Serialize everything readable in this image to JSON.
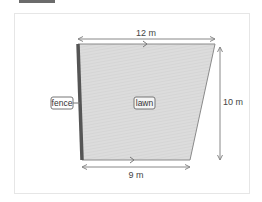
{
  "diagram": {
    "title_bar": "",
    "shape": "trapezoid lawn plot",
    "dimensions": {
      "top": "12 m",
      "bottom": "9 m",
      "height": "10 m"
    },
    "labels": {
      "fence": "fence",
      "lawn": "lawn"
    },
    "colors": {
      "lawn_fill": "#d9d9d9",
      "fence": "#555555",
      "arrow": "#888888",
      "outline": "#8a8a8a"
    }
  }
}
